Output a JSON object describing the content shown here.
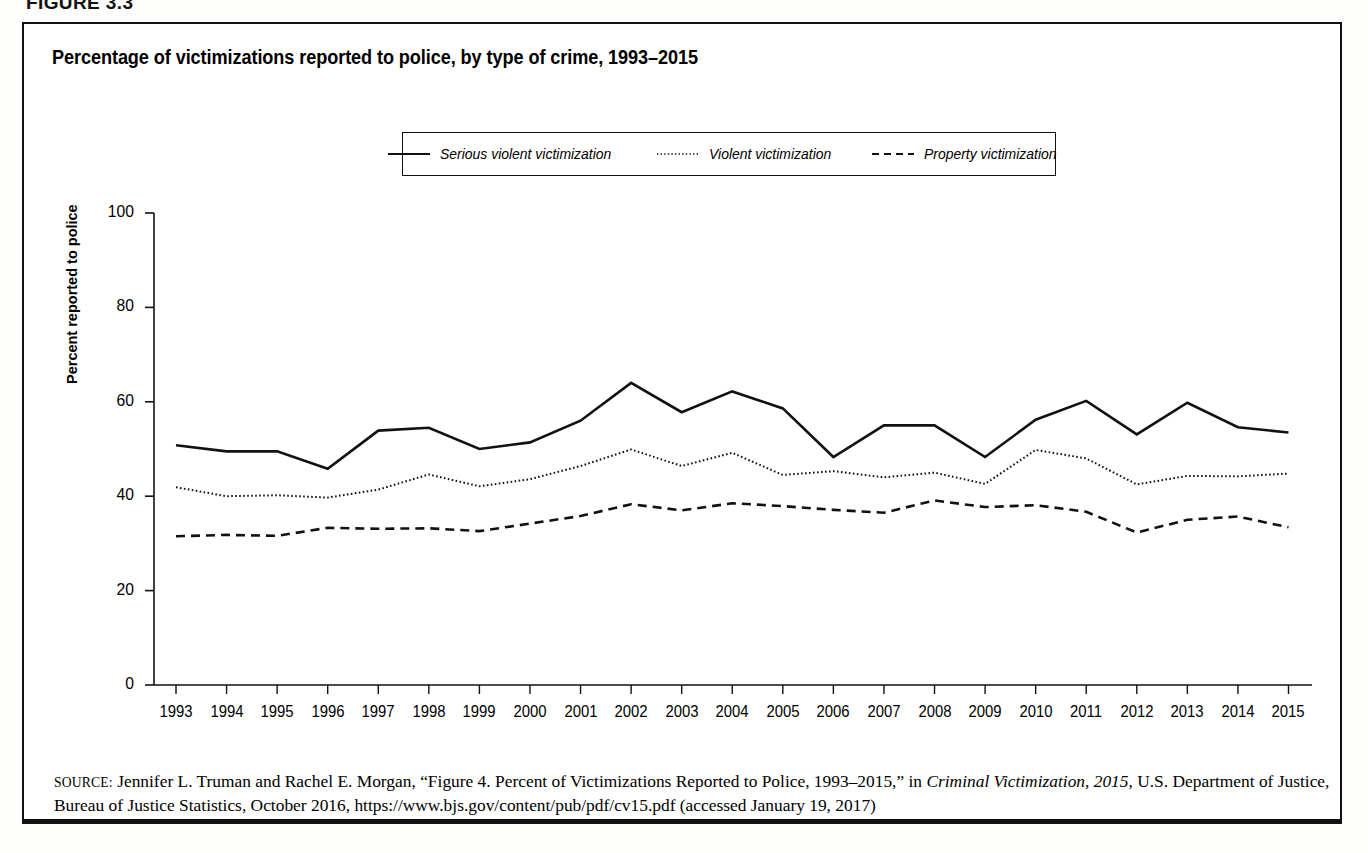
{
  "figure": {
    "label": "FIGURE 3.3",
    "title": "Percentage of victimizations reported to police, by type of crime, 1993–2015"
  },
  "legend": {
    "position": "top-center",
    "items": [
      {
        "label": "Serious violent victimization",
        "style": "solid",
        "icon": "solid-line-icon"
      },
      {
        "label": "Violent victimization",
        "style": "dotted",
        "icon": "dotted-line-icon"
      },
      {
        "label": "Property victimization",
        "style": "dashed",
        "icon": "dashed-line-icon"
      }
    ]
  },
  "source": {
    "prefix": "SOURCE:",
    "text_before_italic": " Jennifer L. Truman and Rachel E. Morgan, “Figure 4. Percent of Victimizations Reported to Police, 1993–2015,” in ",
    "italic_title": "Criminal Victimization, 2015",
    "text_after_italic": ", U.S. Department of Justice, Bureau of Justice Statistics, October 2016, https://www.bjs.gov/content/pub/pdf/cv15.pdf (accessed January 19, 2017)"
  },
  "chart_data": {
    "type": "line",
    "title": "Percentage of victimizations reported to police, by type of crime, 1993–2015",
    "xlabel": "",
    "ylabel": "Percent reported to police",
    "ylim": [
      0,
      100
    ],
    "yticks": [
      0,
      20,
      40,
      60,
      80,
      100
    ],
    "grid": false,
    "legend_position": "top-center",
    "x": [
      1993,
      1994,
      1995,
      1996,
      1997,
      1998,
      1999,
      2000,
      2001,
      2002,
      2003,
      2004,
      2005,
      2006,
      2007,
      2008,
      2009,
      2010,
      2011,
      2012,
      2013,
      2014,
      2015
    ],
    "categories": [
      "1993",
      "1994",
      "1995",
      "1996",
      "1997",
      "1998",
      "1999",
      "2000",
      "2001",
      "2002",
      "2003",
      "2004",
      "2005",
      "2006",
      "2007",
      "2008",
      "2009",
      "2010",
      "2011",
      "2012",
      "2013",
      "2014",
      "2015"
    ],
    "series": [
      {
        "name": "Serious violent victimization",
        "style": "solid",
        "values": [
          50.8,
          49.5,
          49.5,
          45.8,
          53.9,
          54.5,
          50.0,
          51.4,
          56.0,
          64.0,
          57.8,
          62.2,
          58.6,
          48.3,
          55.0,
          55.0,
          48.3,
          56.2,
          60.2,
          53.1,
          59.8,
          54.6,
          53.5
        ]
      },
      {
        "name": "Violent victimization",
        "style": "dotted",
        "values": [
          41.9,
          40.0,
          40.2,
          39.7,
          41.4,
          44.6,
          42.1,
          43.6,
          46.4,
          49.9,
          46.4,
          49.2,
          44.5,
          45.3,
          44.0,
          45.0,
          42.6,
          49.8,
          48.0,
          42.5,
          44.3,
          44.2,
          44.8
        ]
      },
      {
        "name": "Property victimization",
        "style": "dashed",
        "values": [
          31.5,
          31.8,
          31.6,
          33.3,
          33.1,
          33.2,
          32.6,
          34.2,
          35.8,
          38.3,
          37.0,
          38.5,
          37.9,
          37.1,
          36.5,
          39.1,
          37.7,
          38.1,
          36.7,
          32.3,
          35.0,
          35.7,
          33.4
        ]
      }
    ]
  }
}
